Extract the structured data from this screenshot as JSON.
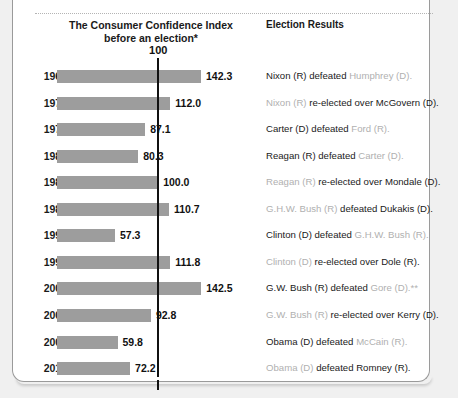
{
  "title": "CONSUMER CONFIDENCE AND PRESIDENTIAL ELECTIONS",
  "headers": {
    "left_line1": "The Consumer Confidence Index",
    "left_line2": "before an election*",
    "right": "Election Results"
  },
  "reference": {
    "label": "100",
    "value": 100
  },
  "colors": {
    "bar": "#9d9d9d",
    "text": "#1a1a1a",
    "dim_text": "#b0b0b0",
    "card_bg": "#ffffff",
    "page_bg": "#f0f0f0",
    "rule": "#111111"
  },
  "chart_data": {
    "type": "bar",
    "title": "CONSUMER CONFIDENCE AND PRESIDENTIAL ELECTIONS",
    "xlabel": "",
    "ylabel": "",
    "orientation": "horizontal",
    "xlim": [
      0,
      150
    ],
    "grid": false,
    "reference_line": 100,
    "categories": [
      "1968",
      "1972",
      "1976",
      "1980",
      "1984",
      "1988",
      "1992",
      "1996",
      "2000",
      "2004",
      "2008",
      "2012"
    ],
    "values": [
      142.3,
      112.0,
      87.1,
      80.3,
      100.0,
      110.7,
      57.3,
      111.8,
      142.5,
      92.8,
      59.8,
      72.2
    ],
    "value_labels": [
      "142.3",
      "112.0",
      "87.1",
      "80.3",
      "100.0",
      "110.7",
      "57.3",
      "111.8",
      "142.5",
      "92.8",
      "59.8",
      "72.2"
    ]
  },
  "rows": [
    {
      "year": "1968",
      "value": 142.3,
      "value_label": "142.3",
      "result_parts": [
        {
          "t": "Nixon (R) defeated ",
          "dim": false
        },
        {
          "t": "Humphrey (D).",
          "dim": true
        }
      ]
    },
    {
      "year": "1972",
      "value": 112.0,
      "value_label": "112.0",
      "result_parts": [
        {
          "t": "Nixon (R) ",
          "dim": true
        },
        {
          "t": "re-elected over McGovern (D).",
          "dim": false
        }
      ]
    },
    {
      "year": "1976",
      "value": 87.1,
      "value_label": "87.1",
      "result_parts": [
        {
          "t": "Carter (D) defeated ",
          "dim": false
        },
        {
          "t": "Ford (R).",
          "dim": true
        }
      ]
    },
    {
      "year": "1980",
      "value": 80.3,
      "value_label": "80.3",
      "result_parts": [
        {
          "t": "Reagan (R) defeated ",
          "dim": false
        },
        {
          "t": "Carter (D).",
          "dim": true
        }
      ]
    },
    {
      "year": "1984",
      "value": 100.0,
      "value_label": "100.0",
      "result_parts": [
        {
          "t": "Reagan (R) ",
          "dim": true
        },
        {
          "t": "re-elected over Mondale (D).",
          "dim": false
        }
      ]
    },
    {
      "year": "1988",
      "value": 110.7,
      "value_label": "110.7",
      "result_parts": [
        {
          "t": "G.H.W. Bush (R) ",
          "dim": true
        },
        {
          "t": "defeated Dukakis (D).",
          "dim": false
        }
      ]
    },
    {
      "year": "1992",
      "value": 57.3,
      "value_label": "57.3",
      "result_parts": [
        {
          "t": "Clinton (D) defeated ",
          "dim": false
        },
        {
          "t": "G.H.W. Bush (R).",
          "dim": true
        }
      ]
    },
    {
      "year": "1996",
      "value": 111.8,
      "value_label": "111.8",
      "result_parts": [
        {
          "t": "Clinton (D) ",
          "dim": true
        },
        {
          "t": "re-elected over Dole (R).",
          "dim": false
        }
      ]
    },
    {
      "year": "2000",
      "value": 142.5,
      "value_label": "142.5",
      "result_parts": [
        {
          "t": "G.W. Bush (R) defeated ",
          "dim": false
        },
        {
          "t": "Gore (D).**",
          "dim": true
        }
      ]
    },
    {
      "year": "2004",
      "value": 92.8,
      "value_label": "92.8",
      "result_parts": [
        {
          "t": "G.W. Bush (R) ",
          "dim": true
        },
        {
          "t": "re-elected over Kerry (D).",
          "dim": false
        }
      ]
    },
    {
      "year": "2008",
      "value": 59.8,
      "value_label": "59.8",
      "result_parts": [
        {
          "t": "Obama (D) defeated ",
          "dim": false
        },
        {
          "t": "McCain (R).",
          "dim": true
        }
      ]
    },
    {
      "year": "2012",
      "value": 72.2,
      "value_label": "72.2",
      "result_parts": [
        {
          "t": "Obama (D) ",
          "dim": true
        },
        {
          "t": "defeated Romney (R).",
          "dim": false
        }
      ]
    }
  ]
}
